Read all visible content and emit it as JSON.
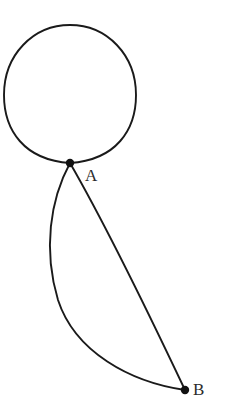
{
  "figure": {
    "type": "graph-diagram",
    "background_color": "#ffffff",
    "stroke_color": "#1a1a1a",
    "dot_color": "#111111",
    "label_color": "#2b2b2b",
    "stroke_width": 1.9,
    "canvas": {
      "width": 230,
      "height": 412
    }
  },
  "vertices": [
    {
      "id": "A",
      "label": "A",
      "x": 70,
      "y": 163,
      "dot_radius": 4.2,
      "label_x": 85,
      "label_y": 167
    },
    {
      "id": "B",
      "label": "B",
      "x": 185,
      "y": 390,
      "dot_radius": 4.2,
      "label_x": 193,
      "label_y": 381
    }
  ],
  "edges": [
    {
      "id": "loop-A",
      "name": "self-loop-at-A",
      "from": "A",
      "to": "A",
      "kind": "self-loop",
      "path": "M 70 163 C 24 160 4 130 4 95 C 4 55 33 25 70 25 C 107 25 136 55 136 95 C 136 130 116 160 70 163 Z"
    },
    {
      "id": "edge-AB-left",
      "name": "edge-A-to-B-left-arc",
      "from": "A",
      "to": "B",
      "kind": "curved",
      "path": "M 70 163 C 50 200 43 250 58 300 C 75 352 130 382 185 390"
    },
    {
      "id": "edge-AB-right",
      "name": "edge-A-to-B-right-arc",
      "from": "A",
      "to": "B",
      "kind": "curved",
      "path": "M 70 163 C 100 215 140 295 185 390"
    }
  ]
}
